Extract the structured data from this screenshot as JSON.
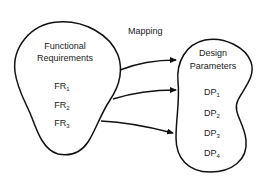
{
  "diagram": {
    "mapping_label": "Mapping",
    "left_set": {
      "title_line1": "Functional",
      "title_line2": "Requirements",
      "items": [
        {
          "base": "FR",
          "sub": "1"
        },
        {
          "base": "FR",
          "sub": "2"
        },
        {
          "base": "FR",
          "sub": "3"
        }
      ]
    },
    "right_set": {
      "title_line1": "Design",
      "title_line2": "Parameters",
      "items": [
        {
          "base": "DP",
          "sub": "1"
        },
        {
          "base": "DP",
          "sub": "2"
        },
        {
          "base": "DP",
          "sub": "3"
        },
        {
          "base": "DP",
          "sub": "4"
        }
      ]
    },
    "arrows": [
      {
        "from": "Functional Requirements",
        "to": "Design Parameters (DP1)"
      },
      {
        "from": "Functional Requirements",
        "to": "Design Parameters (DP2)"
      },
      {
        "from": "Functional Requirements",
        "to": "Design Parameters (DP3)"
      }
    ],
    "colors": {
      "stroke": "#111111",
      "text": "#222222",
      "background": "#ffffff"
    }
  }
}
